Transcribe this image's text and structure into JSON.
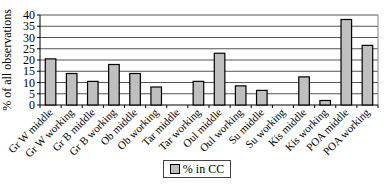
{
  "chart_data": {
    "type": "bar",
    "title": "",
    "xlabel": "",
    "ylabel": "% of all observations",
    "ylim": [
      0,
      40
    ],
    "yticks": [
      0,
      5,
      10,
      15,
      20,
      25,
      30,
      35,
      40
    ],
    "grid": true,
    "legend_position": "bottom",
    "categories": [
      "Gr W middle",
      "Gr W working",
      "Gr B middle",
      "Gr B working",
      "Ob middle",
      "Ob working",
      "Tar middle",
      "Tar working",
      "Oul middle",
      "Oul working",
      "Su middle",
      "Su working",
      "Kis middle",
      "Kis working",
      "POA middle",
      "POA working"
    ],
    "series": [
      {
        "name": "% in CC",
        "color": "#bfbfbf",
        "values": [
          20.5,
          14,
          10.5,
          18,
          14,
          8,
          0,
          10.5,
          23,
          8.5,
          6.5,
          0,
          12.5,
          2,
          38,
          26.5
        ]
      }
    ]
  },
  "legend": {
    "label": "% in CC"
  },
  "colors": {
    "bar_fill": "#bfbfbf",
    "bar_border": "#000000",
    "grid": "#555555",
    "axis": "#000000"
  }
}
